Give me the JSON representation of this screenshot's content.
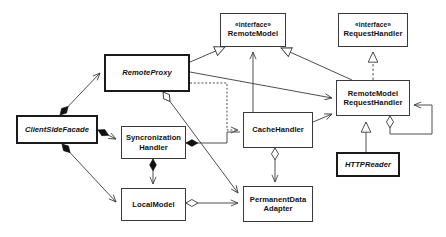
{
  "diagram": {
    "type": "uml-class-diagram",
    "canvas": {
      "width": 446,
      "height": 237,
      "background": "#ffffff"
    },
    "line_color": "#3a3a3a",
    "text_color": "#111111",
    "nodes": [
      {
        "id": "remote_model",
        "stereotype": "«interface»",
        "name": "RemoteModel",
        "kind": "interface",
        "italic": false,
        "thick": false,
        "x": 220,
        "y": 13,
        "w": 66,
        "h": 34
      },
      {
        "id": "request_handler",
        "stereotype": "«interface»",
        "name": "RequestHandler",
        "kind": "interface",
        "italic": false,
        "thick": false,
        "x": 338,
        "y": 13,
        "w": 70,
        "h": 34
      },
      {
        "id": "remote_proxy",
        "stereotype": "",
        "name": "RemoteProxy",
        "kind": "abstract-class",
        "italic": true,
        "thick": true,
        "x": 104,
        "y": 54,
        "w": 86,
        "h": 38
      },
      {
        "id": "remote_model_request_handler",
        "stereotype": "",
        "name": "RemoteModel\nRequestHandler",
        "kind": "class",
        "italic": false,
        "thick": false,
        "x": 336,
        "y": 80,
        "w": 74,
        "h": 36
      },
      {
        "id": "client_side_facade",
        "stereotype": "",
        "name": "ClientSideFacade",
        "kind": "abstract-class",
        "italic": true,
        "thick": true,
        "x": 16,
        "y": 115,
        "w": 82,
        "h": 29
      },
      {
        "id": "syncronization_handler",
        "stereotype": "",
        "name": "Syncronization\nHandler",
        "kind": "class",
        "italic": false,
        "thick": false,
        "x": 121,
        "y": 126,
        "w": 65,
        "h": 33
      },
      {
        "id": "cache_handler",
        "stereotype": "",
        "name": "CacheHandler",
        "kind": "class",
        "italic": false,
        "thick": false,
        "x": 243,
        "y": 112,
        "w": 70,
        "h": 36
      },
      {
        "id": "http_reader",
        "stereotype": "",
        "name": "HTTPReader",
        "kind": "abstract-class",
        "italic": true,
        "thick": true,
        "x": 336,
        "y": 152,
        "w": 64,
        "h": 25
      },
      {
        "id": "local_model",
        "stereotype": "",
        "name": "LocalModel",
        "kind": "class",
        "italic": false,
        "thick": false,
        "x": 121,
        "y": 188,
        "w": 65,
        "h": 33
      },
      {
        "id": "permanent_data_adapter",
        "stereotype": "",
        "name": "PermanentData\nAdapter",
        "kind": "class",
        "italic": false,
        "thick": false,
        "x": 243,
        "y": 186,
        "w": 70,
        "h": 36
      }
    ],
    "relations": [
      {
        "id": "rel-proxy-realizes-remotemodel",
        "from": "remote_proxy",
        "to": "remote_model",
        "type": "realization",
        "label": ""
      },
      {
        "id": "rel-rmrh-realizes-remotemodel",
        "from": "remote_model_request_handler",
        "to": "remote_model",
        "type": "realization",
        "label": ""
      },
      {
        "id": "rel-cachehandler-implements-remotemodel",
        "from": "cache_handler",
        "to": "remote_model",
        "type": "association",
        "label": ""
      },
      {
        "id": "rel-rmrh-inherits-requesthandler",
        "from": "remote_model_request_handler",
        "to": "request_handler",
        "type": "generalization",
        "label": ""
      },
      {
        "id": "rel-httpreader-inherits-rmrh",
        "from": "http_reader",
        "to": "remote_model_request_handler",
        "type": "generalization",
        "label": ""
      },
      {
        "id": "rel-proxy-uses-rmrh",
        "from": "remote_proxy",
        "to": "remote_model_request_handler",
        "type": "association",
        "label": ""
      },
      {
        "id": "rel-proxy-depends-cachehandler",
        "from": "remote_proxy",
        "to": "cache_handler",
        "type": "dependency",
        "label": ""
      },
      {
        "id": "rel-proxy-aggregates-permanentdata",
        "from": "remote_proxy",
        "to": "permanent_data_adapter",
        "type": "aggregation",
        "label": ""
      },
      {
        "id": "rel-facade-composes-proxy",
        "from": "client_side_facade",
        "to": "remote_proxy",
        "type": "composition",
        "label": ""
      },
      {
        "id": "rel-facade-composes-synchandler",
        "from": "client_side_facade",
        "to": "syncronization_handler",
        "type": "composition",
        "label": ""
      },
      {
        "id": "rel-facade-composes-localmodel",
        "from": "client_side_facade",
        "to": "local_model",
        "type": "composition",
        "label": ""
      },
      {
        "id": "rel-synchandler-composes-cachehandler",
        "from": "syncronization_handler",
        "to": "cache_handler",
        "type": "composition",
        "label": ""
      },
      {
        "id": "rel-synchandler-composes-localmodel",
        "from": "syncronization_handler",
        "to": "local_model",
        "type": "composition",
        "label": ""
      },
      {
        "id": "rel-cachehandler-aggregates-permanentdata",
        "from": "cache_handler",
        "to": "permanent_data_adapter",
        "type": "aggregation",
        "label": ""
      },
      {
        "id": "rel-cachehandler-uses-rmrh",
        "from": "cache_handler",
        "to": "remote_model_request_handler",
        "type": "association",
        "label": ""
      },
      {
        "id": "rel-localmodel-aggregates-permanentdata",
        "from": "local_model",
        "to": "permanent_data_adapter",
        "type": "aggregation",
        "label": ""
      },
      {
        "id": "rel-rmrh-self-aggregation",
        "from": "remote_model_request_handler",
        "to": "remote_model_request_handler",
        "type": "aggregation-self",
        "label": ""
      }
    ]
  }
}
